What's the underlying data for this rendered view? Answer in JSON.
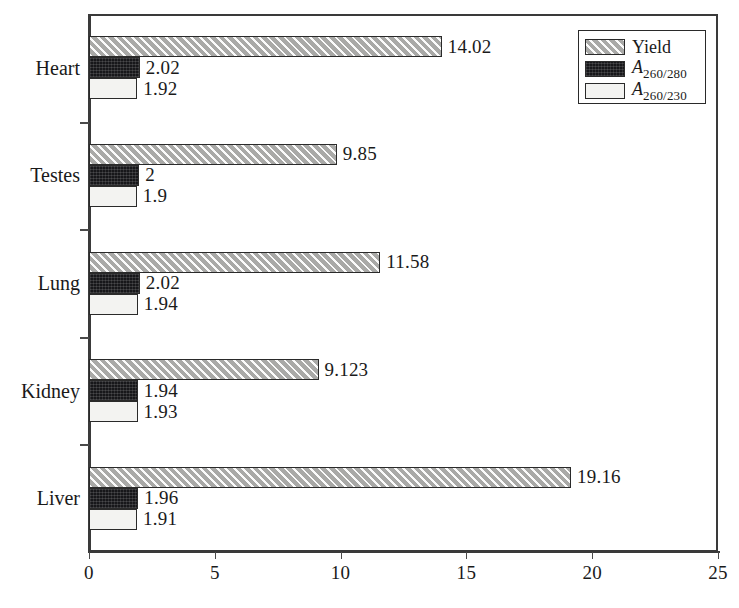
{
  "chart_data": {
    "type": "bar",
    "orientation": "horizontal",
    "title": "",
    "xlabel": "",
    "ylabel": "",
    "categories": [
      "Heart",
      "Testes",
      "Lung",
      "Kidney",
      "Liver"
    ],
    "series": [
      {
        "name": "Yield",
        "key": "yield",
        "values": [
          14.02,
          9.85,
          11.58,
          9.123,
          19.16
        ],
        "labels": [
          "14.02",
          "9.85",
          "11.58",
          "9.123",
          "19.16"
        ],
        "fill": "#a9a9a7",
        "pattern": "diagonal-hatch"
      },
      {
        "name": "A260/280",
        "key": "a280",
        "values": [
          2.02,
          2,
          2.02,
          1.94,
          1.96
        ],
        "labels": [
          "2.02",
          "2",
          "2.02",
          "1.94",
          "1.96"
        ],
        "fill": "#17171a",
        "pattern": "stipple-dark"
      },
      {
        "name": "A260/230",
        "key": "a230",
        "values": [
          1.92,
          1.9,
          1.94,
          1.93,
          1.91
        ],
        "labels": [
          "1.92",
          "1.9",
          "1.94",
          "1.93",
          "1.91"
        ],
        "fill": "#f3f3f1",
        "pattern": "solid-white"
      }
    ],
    "xlim": [
      0,
      25
    ],
    "xticks": [
      0,
      5,
      10,
      15,
      20,
      25
    ],
    "xtick_labels": [
      "0",
      "5",
      "10",
      "15",
      "20",
      "25"
    ],
    "grid": false,
    "legend": {
      "position": "top-right",
      "entries": [
        {
          "label": "Yield",
          "sub": "",
          "italic": false,
          "swatch": "yield"
        },
        {
          "label": "A",
          "sub": "260/280",
          "italic": true,
          "swatch": "a280"
        },
        {
          "label": "A",
          "sub": "260/230",
          "italic": true,
          "swatch": "a230"
        }
      ]
    }
  },
  "colors": {
    "axis": "#3a3a3a",
    "bar_border": "#2a2a2a",
    "yield_fill": "#a9a9a7",
    "a260_280_fill": "#17171a",
    "a260_230_fill": "#f3f3f1",
    "text": "#1a1a1a",
    "background": "#ffffff"
  }
}
